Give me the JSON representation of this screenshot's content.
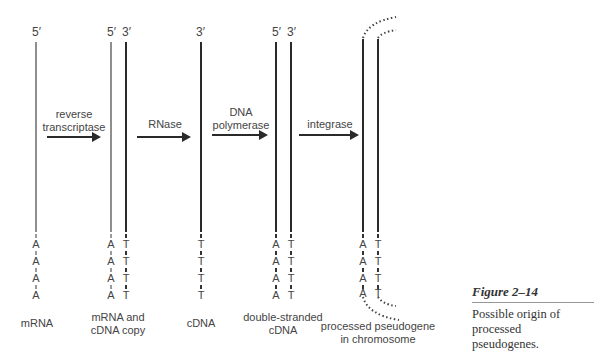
{
  "diagram": {
    "type": "process-flow",
    "stages": [
      {
        "id": "mrna",
        "label": "mRNA",
        "strands": [
          {
            "end_label": "5′",
            "color": "gray",
            "bases": [
              "A",
              "A",
              "A",
              "A"
            ]
          }
        ]
      },
      {
        "id": "hybrid",
        "label_line1": "mRNA and",
        "label_line2": "cDNA copy",
        "strands": [
          {
            "end_label": "5′",
            "color": "gray",
            "bases": [
              "A",
              "A",
              "A",
              "A"
            ]
          },
          {
            "end_label": "3′",
            "color": "black",
            "bases": [
              "T",
              "T",
              "T",
              "T"
            ]
          }
        ]
      },
      {
        "id": "cdna",
        "label": "cDNA",
        "strands": [
          {
            "end_label": "3′",
            "color": "black",
            "bases": [
              "T",
              "T",
              "T",
              "T"
            ]
          }
        ]
      },
      {
        "id": "ds-cdna",
        "label_line1": "double-stranded",
        "label_line2": "cDNA",
        "strands": [
          {
            "end_label": "5′",
            "color": "black",
            "bases": [
              "A",
              "A",
              "A",
              "A"
            ]
          },
          {
            "end_label": "3′",
            "color": "black",
            "bases": [
              "T",
              "T",
              "T",
              "T"
            ]
          }
        ]
      },
      {
        "id": "pseudogene",
        "label_line1": "processed pseudogene",
        "label_line2": "in chromosome",
        "strands": [
          {
            "end_label": "",
            "color": "black",
            "bases": [
              "A",
              "A",
              "A",
              "A"
            ]
          },
          {
            "end_label": "",
            "color": "black",
            "bases": [
              "T",
              "T",
              "T",
              "T"
            ]
          }
        ]
      }
    ],
    "steps": [
      {
        "line1": "reverse",
        "line2": "transcriptase"
      },
      {
        "line1": "RNase",
        "line2": ""
      },
      {
        "line1": "DNA",
        "line2": "polymerase"
      },
      {
        "line1": "integrase",
        "line2": ""
      }
    ]
  },
  "figure": {
    "title": "Figure 2–14",
    "caption_line1": "Possible origin of processed",
    "caption_line2": "pseudogenes."
  },
  "colors": {
    "rna_strand": "#8e8e8e",
    "dna_strand": "#2a2a2a",
    "text": "#444444"
  }
}
